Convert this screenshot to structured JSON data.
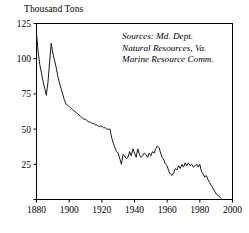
{
  "chart_data": {
    "type": "line",
    "title": "",
    "ylabel": "Thousand Tons",
    "xlabel": "",
    "xlim": [
      1880,
      2000
    ],
    "ylim": [
      0,
      125
    ],
    "grid": false,
    "legend": "none",
    "yticks": [
      0,
      25,
      50,
      75,
      100,
      125
    ],
    "ytick_labels": [
      "",
      "25",
      "50",
      "75",
      "100",
      "125"
    ],
    "xticks": [
      1880,
      1900,
      1920,
      1940,
      1960,
      1980,
      2000
    ],
    "xtick_labels": [
      "1880",
      "1900",
      "1920",
      "1940",
      "1960",
      "1980",
      "2000"
    ],
    "annotations": [
      "Sources: Md. Dept.",
      "Natural Resources, Va.",
      "Marine Resource Comm."
    ],
    "series": [
      {
        "name": "Harvest",
        "x": [
          1880,
          1881,
          1882,
          1883,
          1884,
          1885,
          1886,
          1887,
          1888,
          1889,
          1890,
          1891,
          1892,
          1893,
          1894,
          1895,
          1896,
          1897,
          1898,
          1899,
          1900,
          1901,
          1902,
          1903,
          1904,
          1905,
          1906,
          1907,
          1908,
          1909,
          1910,
          1911,
          1912,
          1913,
          1914,
          1915,
          1916,
          1917,
          1918,
          1919,
          1920,
          1921,
          1922,
          1923,
          1924,
          1925,
          1926,
          1927,
          1928,
          1929,
          1930,
          1931,
          1932,
          1933,
          1934,
          1935,
          1936,
          1937,
          1938,
          1939,
          1940,
          1941,
          1942,
          1943,
          1944,
          1945,
          1946,
          1947,
          1948,
          1949,
          1950,
          1951,
          1952,
          1953,
          1954,
          1955,
          1956,
          1957,
          1958,
          1959,
          1960,
          1961,
          1962,
          1963,
          1964,
          1965,
          1966,
          1967,
          1968,
          1969,
          1970,
          1971,
          1972,
          1973,
          1974,
          1975,
          1976,
          1977,
          1978,
          1979,
          1980,
          1981,
          1982,
          1983,
          1984,
          1985,
          1986,
          1987,
          1988,
          1989,
          1990,
          1991,
          1992,
          1993
        ],
        "values": [
          118,
          105,
          96,
          90,
          84,
          79,
          74,
          83,
          97,
          111,
          104,
          99,
          94,
          88,
          83,
          79,
          75,
          71,
          68,
          67,
          66,
          65,
          64,
          63,
          62,
          61,
          60,
          59,
          58,
          57,
          57,
          56,
          55,
          55,
          54,
          54,
          53,
          53,
          52,
          52,
          52,
          51,
          51,
          50,
          50,
          50,
          44,
          40,
          37,
          34,
          33,
          29,
          25,
          32,
          31,
          29,
          30,
          34,
          31,
          36,
          33,
          30,
          36,
          32,
          30,
          31,
          33,
          32,
          30,
          33,
          31,
          34,
          33,
          36,
          38,
          37,
          33,
          30,
          28,
          25,
          24,
          20,
          18,
          17,
          19,
          22,
          21,
          24,
          22,
          25,
          23,
          26,
          24,
          26,
          24,
          25,
          23,
          24,
          25,
          23,
          25,
          20,
          18,
          16,
          17,
          14,
          12,
          10,
          8,
          6,
          4,
          3,
          2,
          1
        ]
      }
    ]
  }
}
